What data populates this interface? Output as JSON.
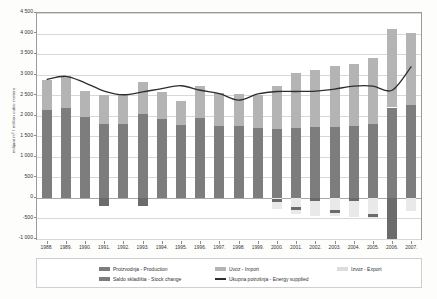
{
  "chart_data": {
    "type": "bar",
    "title": "",
    "xlabel": "",
    "ylabel": "milijuni m³ / million cubic meters",
    "ylim": [
      -1000,
      4500
    ],
    "ytick_step": 500,
    "grid": true,
    "legend_position": "bottom",
    "categories": [
      "1988.",
      "1989.",
      "1990.",
      "1991.",
      "1992.",
      "1993.",
      "1994.",
      "1995.",
      "1996.",
      "1997.",
      "1998.",
      "1999.",
      "2000.",
      "2001.",
      "2002.",
      "2003.",
      "2004.",
      "2005.",
      "2006.",
      "2007."
    ],
    "series": [
      {
        "name": "Proizvodnja - Production",
        "color": "#7d7d7d",
        "values": [
          2130,
          2180,
          1960,
          1800,
          1790,
          2040,
          1930,
          1770,
          1940,
          1760,
          1750,
          1700,
          1680,
          1700,
          1720,
          1730,
          1760,
          1800,
          2200,
          2250
        ]
      },
      {
        "name": "Uvoz - Import",
        "color": "#b4b4b4",
        "values": [
          750,
          790,
          650,
          700,
          710,
          770,
          640,
          600,
          790,
          800,
          790,
          800,
          1050,
          1330,
          1390,
          1470,
          1500,
          1610,
          1900,
          1770
        ]
      },
      {
        "name": "Izvoz - Export",
        "color": "#e9e9e9",
        "values": [
          0,
          0,
          0,
          0,
          0,
          0,
          0,
          0,
          0,
          0,
          0,
          0,
          -280,
          -390,
          -430,
          -450,
          -470,
          -480,
          -920,
          -330
        ]
      },
      {
        "name": "Saldo skladišta - Stock change",
        "color": "#6b6b6b",
        "values": [
          0,
          0,
          0,
          -190,
          0,
          -200,
          0,
          0,
          0,
          0,
          0,
          0,
          -60,
          -250,
          -40,
          -340,
          -40,
          -430,
          -990,
          0
        ]
      },
      {
        "name": "Ukupna potrošnja - Energy supplied",
        "color": "#2e2e2e",
        "type": "line",
        "values": [
          2880,
          2960,
          2800,
          2600,
          2510,
          2580,
          2660,
          2730,
          2620,
          2540,
          2380,
          2530,
          2590,
          2590,
          2600,
          2650,
          2720,
          2720,
          2620,
          3200
        ]
      }
    ],
    "yticks": [
      "4 500",
      "4 000",
      "3 500",
      "3 000",
      "2 500",
      "2 000",
      "1 500",
      "1 000",
      "500",
      "0",
      "-500",
      "-1 000"
    ]
  },
  "legend": {
    "items": [
      {
        "label": "Proizvodnja - Production",
        "icon": "swatch-dark-gray",
        "col": 0,
        "row": 0
      },
      {
        "label": "Saldo skladišta - Stock change",
        "icon": "swatch-dark-gray",
        "col": 0,
        "row": 1
      },
      {
        "label": "Uvoz - Import",
        "icon": "swatch-light-gray",
        "col": 1,
        "row": 0
      },
      {
        "label": "Ukupna potrošnja - Energy supplied",
        "icon": "swatch-line-black",
        "col": 1,
        "row": 1
      },
      {
        "label": "Izvoz - Export",
        "icon": "swatch-pale-gray",
        "col": 2,
        "row": 0
      }
    ]
  }
}
